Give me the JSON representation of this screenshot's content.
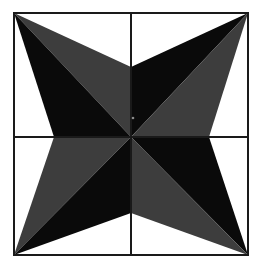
{
  "figure": {
    "title": "Four-Pointed Pinwheel Star",
    "canvas": {
      "width": 260,
      "height": 269,
      "background_color": "#ffffff"
    },
    "frame": {
      "name": "square-border",
      "left": 14,
      "top": 13,
      "right": 248,
      "bottom": 255,
      "stroke_color": "#1a1a1a",
      "stroke_width": 2,
      "fill": "none"
    },
    "crosshair": {
      "name": "center-cross",
      "vertical_x": 131,
      "horizontal_y": 137,
      "stroke_color": "#1a1a1a",
      "stroke_width": 2
    },
    "center_point": {
      "x": 131,
      "y": 137
    },
    "center_dot": {
      "name": "center-speck",
      "x": 133,
      "y": 118,
      "radius": 1.3,
      "color": "#8a8a8a"
    },
    "colors": {
      "black": "#0a0a0a",
      "gray": "#3d3d3d",
      "white": "#ffffff",
      "line": "#1a1a1a"
    },
    "star": {
      "name": "four-pointed-star",
      "tips": [
        {
          "label": "top-left-tip",
          "x": 14,
          "y": 13
        },
        {
          "label": "top-right-tip",
          "x": 248,
          "y": 13
        },
        {
          "label": "bottom-right-tip",
          "x": 248,
          "y": 255
        },
        {
          "label": "bottom-left-tip",
          "x": 14,
          "y": 255
        }
      ],
      "notches": [
        {
          "label": "top-notch",
          "x": 131,
          "y": 67
        },
        {
          "label": "right-notch",
          "x": 209,
          "y": 137
        },
        {
          "label": "bottom-notch",
          "x": 131,
          "y": 213
        },
        {
          "label": "left-notch",
          "x": 54,
          "y": 137
        }
      ]
    },
    "facets": [
      {
        "name": "facet-tl-upper",
        "shade": "gray",
        "points": "14,13 131,67 131,137"
      },
      {
        "name": "facet-tl-lower",
        "shade": "black",
        "points": "14,13 131,137 54,137"
      },
      {
        "name": "facet-tr-upper",
        "shade": "black",
        "points": "248,13 131,137 131,67"
      },
      {
        "name": "facet-tr-lower",
        "shade": "gray",
        "points": "248,13 209,137 131,137"
      },
      {
        "name": "facet-br-upper",
        "shade": "black",
        "points": "248,255 131,137 209,137"
      },
      {
        "name": "facet-br-lower",
        "shade": "gray",
        "points": "248,255 131,213 131,137"
      },
      {
        "name": "facet-bl-upper",
        "shade": "gray",
        "points": "14,255 54,137 131,137"
      },
      {
        "name": "facet-bl-lower",
        "shade": "black",
        "points": "14,255 131,137 131,213"
      }
    ]
  }
}
